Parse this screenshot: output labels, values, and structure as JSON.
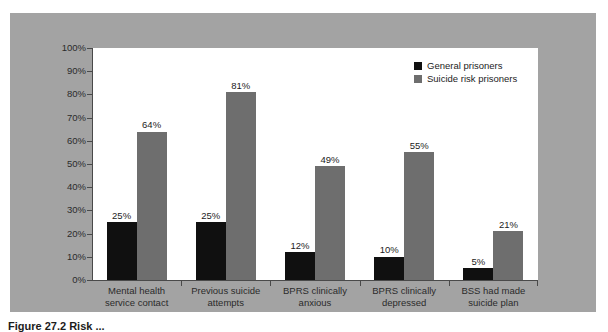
{
  "figure": {
    "caption": "Figure 27.2 Risk ..."
  },
  "legend": {
    "position": "top-right",
    "entries": [
      {
        "label": "General prisoners",
        "color": "#101010",
        "swatch": "legend-swatch-general"
      },
      {
        "label": "Suicide risk prisoners",
        "color": "#6e6e6e",
        "swatch": "legend-swatch-risk"
      }
    ]
  },
  "yaxis": {
    "ticks": [
      "100%",
      "90%",
      "80%",
      "70%",
      "60%",
      "50%",
      "40%",
      "30%",
      "20%",
      "10%",
      "0%"
    ]
  },
  "chart_data": {
    "type": "bar",
    "title": "",
    "subtitle": "",
    "xlabel": "",
    "ylabel": "",
    "ylim": [
      0,
      100
    ],
    "ytick_step": 10,
    "ytick_format": "percent",
    "grid": false,
    "legend_position": "top-right",
    "categories": [
      "Mental health service contact",
      "Previous suicide attempts",
      "BPRS clinically anxious",
      "BPRS clinically depressed",
      "BSS had made suicide plan"
    ],
    "category_lines": [
      [
        "Mental health",
        "service contact"
      ],
      [
        "Previous suicide",
        "attempts"
      ],
      [
        "BPRS clinically",
        "anxious"
      ],
      [
        "BPRS clinically",
        "depressed"
      ],
      [
        "BSS had made",
        "suicide plan"
      ]
    ],
    "series": [
      {
        "name": "General prisoners",
        "color": "#101010",
        "values": [
          25,
          25,
          12,
          10,
          5
        ],
        "labels": [
          "25%",
          "25%",
          "12%",
          "10%",
          "5%"
        ]
      },
      {
        "name": "Suicide risk prisoners",
        "color": "#6e6e6e",
        "values": [
          64,
          81,
          49,
          55,
          21
        ],
        "labels": [
          "64%",
          "81%",
          "49%",
          "55%",
          "21%"
        ]
      }
    ]
  },
  "colors": {
    "panel_background": "#a3a3a3",
    "plot_background": "#ffffff",
    "axis": "#4a4a4a",
    "series_general": "#101010",
    "series_risk": "#6e6e6e"
  }
}
